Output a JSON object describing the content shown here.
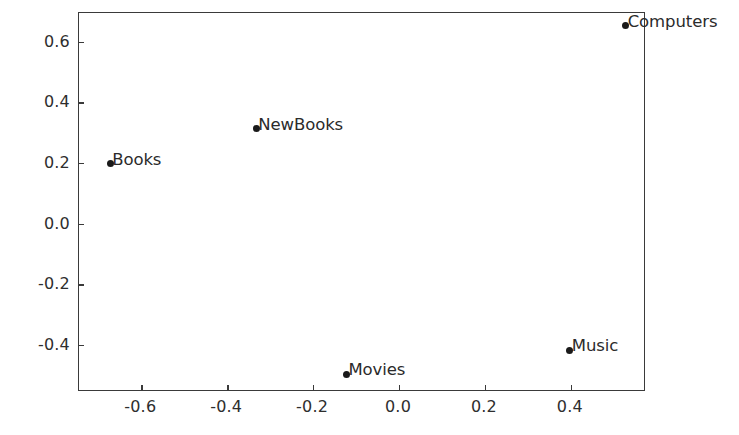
{
  "chart_data": {
    "type": "scatter",
    "title": "",
    "xlabel": "",
    "ylabel": "",
    "xlim": [
      -0.745,
      0.575
    ],
    "ylim": [
      -0.555,
      0.695
    ],
    "grid": false,
    "legend": null,
    "xticks": [
      "-0.6",
      "-0.4",
      "-0.2",
      "0.0",
      "0.2",
      "0.4"
    ],
    "xtick_values": [
      -0.6,
      -0.4,
      -0.2,
      0.0,
      0.2,
      0.4
    ],
    "yticks": [
      "0.6",
      "0.4",
      "0.2",
      "0.0",
      "-0.2",
      "-0.4"
    ],
    "ytick_values": [
      0.6,
      0.4,
      0.2,
      0.0,
      -0.2,
      -0.4
    ],
    "marker": "circle",
    "marker_color": "#1a1a1a",
    "points": [
      {
        "label": "Computers",
        "x": 0.53,
        "y": 0.65
      },
      {
        "label": "NewBooks",
        "x": -0.33,
        "y": 0.31
      },
      {
        "label": "Books",
        "x": -0.67,
        "y": 0.195
      },
      {
        "label": "Music",
        "x": 0.4,
        "y": -0.42
      },
      {
        "label": "Movies",
        "x": -0.12,
        "y": -0.5
      }
    ]
  },
  "figure": {
    "background_color": "#ffffff",
    "axis_color": "#3a3a3a",
    "text_color": "#2b2b2b"
  }
}
